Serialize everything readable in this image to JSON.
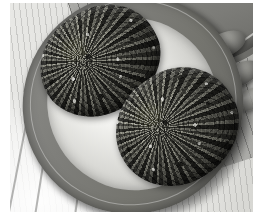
{
  "image": {
    "kind": "photograph",
    "subject": "Two herb-crusted breaded cutlets on a dark oval platter",
    "palette": "desaturated grayscale",
    "frame_color": "#ffffff",
    "photo_bounds": {
      "x": 10,
      "y": 3,
      "width": 243,
      "height": 209
    }
  },
  "scene": {
    "background": {
      "name": "striped wooden board",
      "color_light": "#f4f4f2",
      "color_dark": "#cfcfcb"
    },
    "cloth": {
      "name": "striped cloth napkin",
      "color": "#a9a9a5",
      "stripe_color": "#464644"
    },
    "bowl": {
      "name": "bowl rim",
      "color": "#7c7c78",
      "rim_color": "#6d6d69"
    },
    "platter": {
      "name": "oval serving platter",
      "rim_color": "#7e7e7a",
      "well_color": "#f2f2ef",
      "rotation_deg": -37
    },
    "food_items": [
      {
        "label": "crusted cutlet upper-left",
        "crust_color": "#4e4e4b",
        "highlight_color": "#8e8e88"
      },
      {
        "label": "crusted cutlet lower-right",
        "crust_color": "#454542",
        "highlight_color": "#85857f"
      }
    ],
    "garnish": [
      {
        "label": "olive one",
        "color": "#575754"
      },
      {
        "label": "olive two",
        "color": "#575754"
      },
      {
        "label": "olive three",
        "color": "#6a6a66"
      }
    ]
  }
}
